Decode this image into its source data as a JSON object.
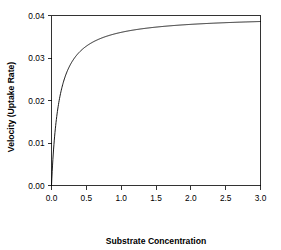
{
  "chart_data": {
    "type": "line",
    "title": "",
    "xlabel": "Substrate Concentration",
    "ylabel": "Velocity (Uptake Rate)",
    "xlim": [
      0,
      3
    ],
    "ylim": [
      0,
      0.04
    ],
    "grid": false,
    "legend": null,
    "xticks": [
      "0.0",
      "0.5",
      "1.0",
      "1.5",
      "2.0",
      "2.5",
      "3.0"
    ],
    "xtick_values": [
      0,
      0.5,
      1.0,
      1.5,
      2.0,
      2.5,
      3.0
    ],
    "yticks": [
      "0.00",
      "0.01",
      "0.02",
      "0.03",
      "0.04"
    ],
    "ytick_values": [
      0,
      0.01,
      0.02,
      0.03,
      0.04
    ],
    "model": "Michaelis-Menten",
    "parameters": {
      "Vmax": 0.04,
      "Km": 0.11
    },
    "line_color": "#000000",
    "line_width": 0.9,
    "series": [
      {
        "name": "velocity",
        "x": [
          0,
          0.02,
          0.04,
          0.06,
          0.08,
          0.1,
          0.125,
          0.15,
          0.175,
          0.2,
          0.25,
          0.3,
          0.35,
          0.4,
          0.5,
          0.6,
          0.7,
          0.8,
          0.9,
          1.0,
          1.2,
          1.4,
          1.6,
          1.8,
          2.0,
          2.25,
          2.5,
          2.75,
          3.0
        ],
        "y": [
          0.0,
          0.00615,
          0.01067,
          0.01412,
          0.01684,
          0.01905,
          0.02128,
          0.02308,
          0.02456,
          0.02581,
          0.02778,
          0.02927,
          0.03043,
          0.03137,
          0.03279,
          0.0338,
          0.03457,
          0.03516,
          0.03564,
          0.03604,
          0.03664,
          0.03708,
          0.03742,
          0.03768,
          0.0379,
          0.03813,
          0.03831,
          0.03846,
          0.03859
        ]
      }
    ]
  },
  "axes": {
    "x_axis_name": "x-axis",
    "y_axis_name": "y-axis"
  }
}
